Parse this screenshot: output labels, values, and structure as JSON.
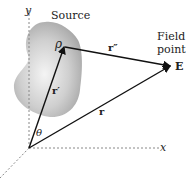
{
  "diagram": {
    "labels": {
      "y_axis": "y",
      "x_axis": "x",
      "source": "Source",
      "field_point_line1": "Field",
      "field_point_line2": "point",
      "field_point_symbol": "E",
      "rho": "ρ",
      "r_prime": "r′",
      "r_double_prime": "r″",
      "r": "r",
      "theta": "θ"
    },
    "colors": {
      "source_fill": "#bdbdbd",
      "line": "#111111",
      "axis": "#888888"
    }
  }
}
